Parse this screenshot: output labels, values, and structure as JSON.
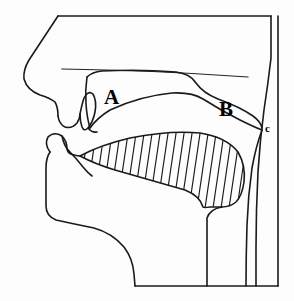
{
  "figure": {
    "kind": "anatomical-line-diagram",
    "background_color": "#fdfdfd",
    "stroke_color": "#1a1a1a"
  },
  "labels": [
    {
      "id": "A",
      "text": "A",
      "x": 112,
      "y": 96,
      "size": "major",
      "refers_to": "hard-palate-oral-cavity"
    },
    {
      "id": "B",
      "text": "B",
      "x": 227,
      "y": 108,
      "size": "major",
      "refers_to": "soft-palate-velum"
    },
    {
      "id": "c",
      "text": "c",
      "x": 267,
      "y": 129,
      "size": "minor",
      "refers_to": "velic-closure-point-pharyngeal-wall"
    }
  ],
  "regions": {
    "nasal_cavity": "nasal-cavity",
    "oral_cavity": "oral-cavity",
    "tongue": "tongue-hatched",
    "pharynx": "pharyngeal-cavity",
    "lips": "lips",
    "jaw": "lower-jaw"
  },
  "paths": {
    "head_outline": "M 58 16 L 271 16",
    "skull_left": "M 58 16 L 27 62 L 23 76 L 25 87 L 34 95 L 52 99 L 57 104 L 58 116 L 62 124 L 70 127 L 77 123 L 80 116",
    "nasal_floor": "M 62 69 L 246 76",
    "hard_palate_upper": "M 89 73 Q 140 69 178 72 Q 195 75 196 84",
    "velum_upper": "M 196 84 Q 215 94 238 102 Q 252 108 260 120",
    "hard_palate_lower": "M 85 113 Q 130 100 176 95 Q 196 94 206 101",
    "velum_lower": "M 206 101 Q 232 116 250 124 Q 258 128 261 131",
    "alveolar_hook": "M 80 116 Q 83 100 88 92 Q 93 86 96 96 Q 98 110 92 119 Q 86 126 82 121",
    "upper_teeth_tip": "M 82 121 Q 84 128 89 129",
    "oral_roof_front": "M 89 129 Q 95 120 105 113",
    "pharynx_front_wall": "M 261 131 Q 256 150 252 175 Q 249 210 248 245 L 248 286",
    "pharynx_back_wall": "M 271 16 L 271 60 Q 266 90 262 118 Q 258 150 256 185 Q 255 235 255 286",
    "border_right": "M 278 16 L 278 286",
    "border_bottom": "M 135 286 L 278 286",
    "tongue_top": "M 80 156 Q 100 145 130 138 Q 170 130 200 133 Q 226 137 238 152 Q 246 166 244 182 Q 242 196 236 202",
    "tongue_root": "M 236 202 Q 230 207 222 207 L 210 207 Q 204 208 203 216 L 203 286",
    "tongue_bottom": "M 80 156 Q 95 164 115 170 Q 150 180 185 190 Q 200 195 203 202",
    "lower_lip": "M 52 147 Q 46 140 52 136 Q 60 133 64 140 Q 66 150 72 152 Q 78 154 80 156",
    "lower_lip_inner": "M 64 140 Q 66 148 72 152",
    "lower_teeth": "M 72 152 Q 78 158 84 166 Q 90 174 94 178",
    "jaw_outline": "M 52 147 Q 48 152 47 162 L 47 208 Q 47 218 55 222 Q 70 226 90 228 Q 110 232 122 246 Q 132 258 134 272 L 135 286"
  },
  "hatching": {
    "description": "diagonal hatch fill of tongue body",
    "angle_deg": 11,
    "spacing_px": 8,
    "count": 24
  }
}
